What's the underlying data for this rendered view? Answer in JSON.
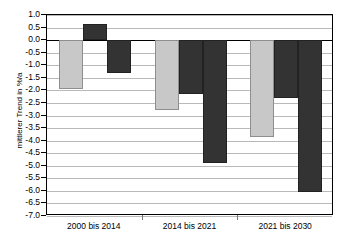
{
  "chart_data": {
    "type": "bar",
    "title": "",
    "subtitle": "",
    "xlabel": "",
    "ylabel": "mittlerer Trend in %/a",
    "categories": [
      "2000 bis 2014",
      "2014 bis 2021",
      "2021 bis 2030"
    ],
    "series": [
      {
        "name": "series-1",
        "color": "#c8c8c8",
        "values": [
          -1.95,
          -2.8,
          -3.85
        ]
      },
      {
        "name": "series-2",
        "color": "#333333",
        "values": [
          0.65,
          -2.15,
          -2.3
        ]
      },
      {
        "name": "series-3",
        "color": "#333333",
        "values": [
          -1.3,
          -4.9,
          -6.05
        ]
      }
    ],
    "ylim": [
      -7.0,
      1.0
    ],
    "ytick_step": 0.5,
    "ytick_labels": [
      "1.0",
      "0.5",
      "0.0",
      "-0.5",
      "-1.0",
      "-1.5",
      "-2.0",
      "-2.5",
      "-3.0",
      "-3.5",
      "-4.0",
      "-4.5",
      "-5.0",
      "-5.5",
      "-6.0",
      "-6.5",
      "-7.0"
    ],
    "ytick_values": [
      1.0,
      0.5,
      0.0,
      -0.5,
      -1.0,
      -1.5,
      -2.0,
      -2.5,
      -3.0,
      -3.5,
      -4.0,
      -4.5,
      -5.0,
      -5.5,
      -6.0,
      -6.5,
      -7.0
    ],
    "grid": true,
    "legend": "none",
    "zero_line": 0.0,
    "colors": {
      "light_bar": "#c8c8c8",
      "dark_bar": "#333333",
      "gridline": "#b9b9b9",
      "axis": "#000000",
      "background": "#ffffff"
    }
  }
}
